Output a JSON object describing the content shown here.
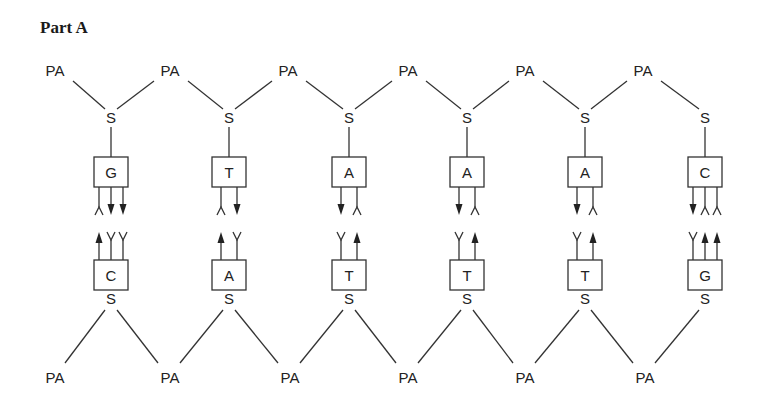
{
  "title": "Part A",
  "labels": {
    "phosphate": "PA",
    "sugar": "S"
  },
  "columns": [
    {
      "x": 111,
      "top_base": "G",
      "bottom_base": "C",
      "top_bonds": [
        "acceptor",
        "donor",
        "donor"
      ],
      "bottom_bonds": [
        "donor",
        "acceptor",
        "acceptor"
      ]
    },
    {
      "x": 229,
      "top_base": "T",
      "bottom_base": "A",
      "top_bonds": [
        "acceptor",
        "donor"
      ],
      "bottom_bonds": [
        "donor",
        "acceptor"
      ]
    },
    {
      "x": 349,
      "top_base": "A",
      "bottom_base": "T",
      "top_bonds": [
        "donor",
        "acceptor"
      ],
      "bottom_bonds": [
        "acceptor",
        "donor"
      ]
    },
    {
      "x": 467,
      "top_base": "A",
      "bottom_base": "T",
      "top_bonds": [
        "donor",
        "acceptor"
      ],
      "bottom_bonds": [
        "acceptor",
        "donor"
      ]
    },
    {
      "x": 585,
      "top_base": "A",
      "bottom_base": "T",
      "top_bonds": [
        "donor",
        "acceptor"
      ],
      "bottom_bonds": [
        "acceptor",
        "donor"
      ]
    },
    {
      "x": 705,
      "top_base": "C",
      "bottom_base": "G",
      "top_bonds": [
        "donor",
        "acceptor",
        "acceptor"
      ],
      "bottom_bonds": [
        "acceptor",
        "donor",
        "donor"
      ]
    }
  ],
  "top_pa_x": [
    55,
    170,
    288,
    408,
    525,
    643
  ],
  "bottom_pa_x": [
    55,
    170,
    290,
    408,
    525,
    645
  ]
}
